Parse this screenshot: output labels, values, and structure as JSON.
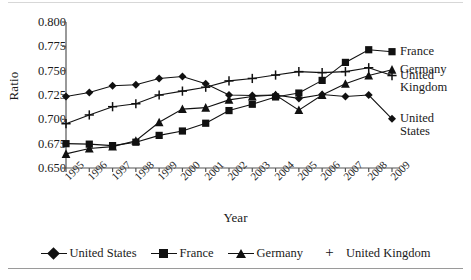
{
  "chart_data": {
    "type": "line",
    "title": "",
    "xlabel": "Year",
    "ylabel": "Ratio",
    "grid": false,
    "legend_position": "bottom",
    "x": [
      1995,
      1996,
      1997,
      1998,
      1999,
      2000,
      2001,
      2002,
      2003,
      2004,
      2005,
      2006,
      2007,
      2008,
      2009
    ],
    "xtick_labels": [
      "1995",
      "1996",
      "1997",
      "1998",
      "1999",
      "2000",
      "2001",
      "2002",
      "2003",
      "2004",
      "2005",
      "2006",
      "2007",
      "2008",
      "2009"
    ],
    "ytick_labels": [
      "0.800",
      "0.775",
      "0.750",
      "0.725",
      "0.700",
      "0.675",
      "0.650"
    ],
    "ytick_values": [
      0.8,
      0.775,
      0.75,
      0.725,
      0.7,
      0.675,
      0.65
    ],
    "ylim": [
      0.65,
      0.8
    ],
    "series": [
      {
        "name": "United States",
        "marker": "diamond",
        "values": [
          0.7235,
          0.7275,
          0.7345,
          0.7355,
          0.742,
          0.744,
          0.7365,
          0.725,
          0.7245,
          0.725,
          0.7215,
          0.7255,
          0.7235,
          0.725,
          0.7005
        ]
      },
      {
        "name": "France",
        "marker": "square",
        "values": [
          0.675,
          0.6745,
          0.673,
          0.6765,
          0.6835,
          0.688,
          0.696,
          0.709,
          0.7155,
          0.723,
          0.727,
          0.74,
          0.7585,
          0.7715,
          0.7695
        ]
      },
      {
        "name": "Germany",
        "marker": "triangle",
        "values": [
          0.6645,
          0.67,
          0.672,
          0.678,
          0.697,
          0.7105,
          0.712,
          0.72,
          0.7235,
          0.725,
          0.7095,
          0.725,
          0.7365,
          0.745,
          0.751
        ]
      },
      {
        "name": "United Kingdom",
        "marker": "plus",
        "values": [
          0.6955,
          0.7045,
          0.713,
          0.716,
          0.725,
          0.729,
          0.733,
          0.7395,
          0.742,
          0.7455,
          0.749,
          0.748,
          0.749,
          0.753,
          0.745
        ]
      }
    ],
    "end_labels": [
      {
        "text": "France",
        "series": "France"
      },
      {
        "text": "Germany",
        "series": "Germany"
      },
      {
        "text": "United\nKingdom",
        "series": "United Kingdom"
      },
      {
        "text": "United\nStates",
        "series": "United States"
      }
    ],
    "legend": [
      {
        "label": "United States",
        "marker": "diamond"
      },
      {
        "label": "France",
        "marker": "square"
      },
      {
        "label": "Germany",
        "marker": "triangle"
      },
      {
        "label": "United Kingdom",
        "marker": "plus"
      }
    ],
    "colors": {
      "ink": "#111111",
      "axis": "#555555",
      "rule": "#9a9a9a"
    }
  }
}
